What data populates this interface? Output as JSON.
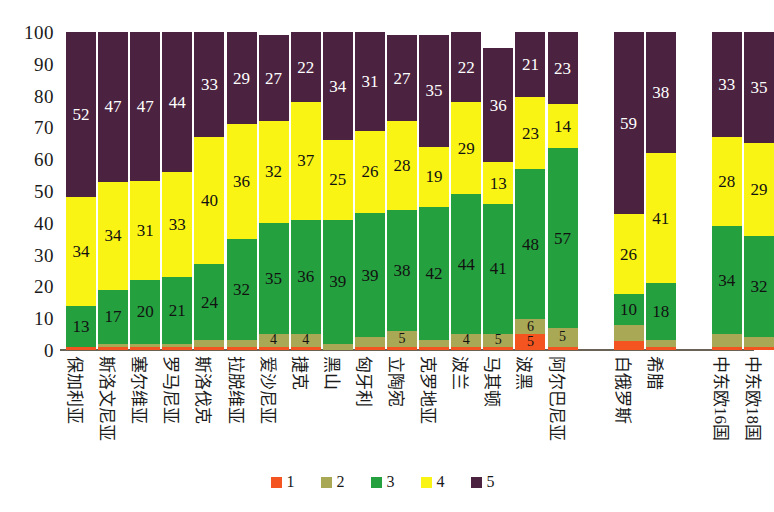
{
  "chart_data": {
    "type": "bar",
    "stacked": true,
    "stack_total": 100,
    "title": "",
    "xlabel": "",
    "ylabel": "",
    "ylim": [
      0,
      100
    ],
    "ytick_labels": [
      "100",
      "90",
      "80",
      "70",
      "60",
      "50",
      "40",
      "30",
      "20",
      "10",
      "0"
    ],
    "yticks": [
      100,
      90,
      80,
      70,
      60,
      50,
      40,
      30,
      20,
      10,
      0
    ],
    "grid": false,
    "legend_position": "bottom",
    "legend": [
      "1",
      "2",
      "3",
      "4",
      "5"
    ],
    "series_colors": [
      "#f4541f",
      "#a9a855",
      "#25a03f",
      "#faf415",
      "#4b2340"
    ],
    "categories": [
      "保加利亚",
      "斯洛文尼亚",
      "塞尔维亚",
      "罗马尼亚",
      "斯洛伐克",
      "拉脱维亚",
      "爱沙尼亚",
      "捷克",
      "黑山",
      "匈牙利",
      "立陶宛",
      "克罗地亚",
      "波兰",
      "马其顿",
      "波黑",
      "阿尔巴尼亚",
      "白俄罗斯",
      "希腊",
      "中东欧16国",
      "中东欧18国"
    ],
    "group_breaks_after": [
      "阿尔巴尼亚",
      "希腊"
    ],
    "series": [
      {
        "name": "1",
        "values": [
          1,
          1,
          1,
          1,
          1,
          1,
          1,
          1,
          0,
          1,
          1,
          1,
          1,
          1,
          5,
          1,
          3,
          1,
          1,
          1
        ]
      },
      {
        "name": "2",
        "values": [
          0,
          1,
          1,
          1,
          2,
          2,
          4,
          4,
          2,
          3,
          5,
          2,
          4,
          4,
          5,
          6,
          5,
          2,
          4,
          3
        ]
      },
      {
        "name": "3",
        "values": [
          13,
          17,
          20,
          21,
          24,
          32,
          35,
          36,
          39,
          39,
          38,
          42,
          44,
          41,
          48,
          57,
          10,
          18,
          34,
          32
        ]
      },
      {
        "name": "4",
        "values": [
          34,
          34,
          31,
          33,
          40,
          36,
          32,
          37,
          25,
          26,
          28,
          19,
          29,
          13,
          23,
          14,
          26,
          41,
          28,
          29
        ]
      },
      {
        "name": "5",
        "values": [
          52,
          47,
          47,
          44,
          33,
          29,
          27,
          22,
          34,
          31,
          27,
          35,
          22,
          36,
          21,
          23,
          59,
          38,
          33,
          35
        ]
      }
    ],
    "visible_labels": {
      "1": [
        "",
        "",
        "",
        "",
        "",
        "",
        "",
        "",
        "",
        "",
        "",
        "",
        "",
        "",
        "5",
        "",
        "",
        "",
        "",
        ""
      ],
      "2": [
        "",
        "",
        "",
        "",
        "",
        "",
        "4",
        "4",
        "",
        "",
        "5",
        "",
        "4",
        "5",
        "6",
        "5",
        "",
        "",
        "",
        ""
      ],
      "3": [
        "13",
        "17",
        "20",
        "21",
        "24",
        "32",
        "35",
        "36",
        "39",
        "39",
        "38",
        "42",
        "44",
        "41",
        "48",
        "57",
        "10",
        "18",
        "34",
        "32"
      ],
      "4": [
        "34",
        "34",
        "31",
        "33",
        "40",
        "36",
        "32",
        "37",
        "25",
        "26",
        "28",
        "19",
        "29",
        "13",
        "23",
        "14",
        "26",
        "41",
        "28",
        "29"
      ],
      "5": [
        "52",
        "47",
        "47",
        "44",
        "33",
        "29",
        "27",
        "22",
        "34",
        "31",
        "27",
        "35",
        "22",
        "36",
        "21",
        "23",
        "59",
        "38",
        "33",
        "35"
      ]
    }
  }
}
